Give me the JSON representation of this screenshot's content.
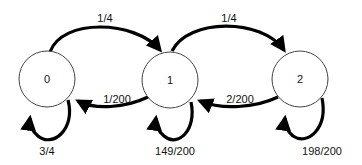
{
  "diagram": {
    "type": "markov-chain-state-diagram",
    "nodes": [
      {
        "id": "0",
        "label": "0"
      },
      {
        "id": "1",
        "label": "1"
      },
      {
        "id": "2",
        "label": "2"
      }
    ],
    "edges": [
      {
        "from": "0",
        "to": "1",
        "label": "1/4"
      },
      {
        "from": "1",
        "to": "2",
        "label": "1/4"
      },
      {
        "from": "1",
        "to": "0",
        "label": "1/200"
      },
      {
        "from": "2",
        "to": "1",
        "label": "2/200"
      },
      {
        "from": "0",
        "to": "0",
        "label": "3/4"
      },
      {
        "from": "1",
        "to": "1",
        "label": "149/200"
      },
      {
        "from": "2",
        "to": "2",
        "label": "198/200"
      }
    ]
  }
}
